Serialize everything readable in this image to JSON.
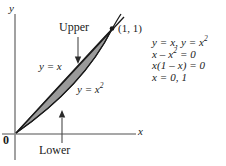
{
  "figure": {
    "type": "math-region-diagram",
    "axes": {
      "y_axis_label": "y",
      "x_axis_label": "x",
      "origin_label": "0"
    },
    "curves": [
      {
        "name": "upper-boundary",
        "label": "y = x",
        "equation": "y = x"
      },
      {
        "name": "lower-boundary",
        "label": "y = x2",
        "equation": "y = x^2"
      }
    ],
    "labels": {
      "y_equals_x": "y = x",
      "y_equals_x_base": "y = x",
      "y_equals_x_squared_base": "y = x",
      "squared_exponent": "2",
      "upper": "Upper",
      "lower": "Lower",
      "intersection_point": "(1, 1)"
    },
    "region": {
      "fill_color": "#9a9a9a",
      "stroke_color": "#1a1a1a"
    }
  },
  "equations": {
    "lines": [
      {
        "id": "line-1",
        "prefix": "y = x, y = x",
        "exponent": "2",
        "suffix": ""
      },
      {
        "id": "line-2",
        "prefix": "x – x",
        "exponent": "2",
        "suffix": " = 0"
      },
      {
        "id": "line-3",
        "prefix": "x(1 – x) = 0",
        "exponent": "",
        "suffix": ""
      },
      {
        "id": "line-4",
        "prefix": "x = 0, 1",
        "exponent": "",
        "suffix": ""
      }
    ]
  },
  "colors": {
    "ink": "#1a1a1a",
    "axis": "#7d7d7d",
    "shade": "#9a9a9a",
    "background": "#ffffff"
  }
}
